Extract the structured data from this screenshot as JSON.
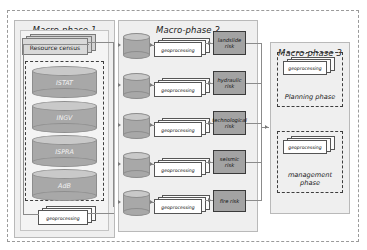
{
  "diagram": {
    "type": "flowchart",
    "title_visible": false,
    "colors": {
      "panel_fill": "#efefef",
      "panel_border": "#b9b9b9",
      "inner_panel_fill": "#f4f4f4",
      "cylinder_body": "#a8a8a8",
      "cylinder_top": "#c9c9c9",
      "risk_box_fill": "#a3a3a3",
      "risk_box_border": "#3a3a3a",
      "card_fill": "#ffffff",
      "card_border": "#555555",
      "dashed_border": "#3d3d3d",
      "outer_dashed_border": "#9a9a9a",
      "connector": "#8b8b8b",
      "resource_census_fill": "#d3d3d3"
    }
  },
  "macro_phase_1": {
    "title": "Macro-phase 1",
    "resource_census": {
      "label": "Resource census"
    },
    "databases": [
      {
        "label": "ISTAT",
        "icon": "database-cylinder-icon"
      },
      {
        "label": "INGV",
        "icon": "database-cylinder-icon"
      },
      {
        "label": "ISPRA",
        "icon": "database-cylinder-icon"
      },
      {
        "label": "AdB",
        "icon": "database-cylinder-icon"
      }
    ],
    "geoprocessing": {
      "label": "geoprocessing"
    }
  },
  "macro_phase_2": {
    "title": "Macro-phase 2",
    "rows": [
      {
        "database": {
          "label": "",
          "icon": "database-cylinder-icon"
        },
        "geoprocessing": {
          "label": "geoprocessing"
        },
        "risk": {
          "label": "landslide risk"
        }
      },
      {
        "database": {
          "label": "",
          "icon": "database-cylinder-icon"
        },
        "geoprocessing": {
          "label": "geoprocessing"
        },
        "risk": {
          "label": "hydraulic risk"
        }
      },
      {
        "database": {
          "label": "",
          "icon": "database-cylinder-icon"
        },
        "geoprocessing": {
          "label": "geoprocessing"
        },
        "risk": {
          "label": "technological risk"
        }
      },
      {
        "database": {
          "label": "",
          "icon": "database-cylinder-icon"
        },
        "geoprocessing": {
          "label": "geoprocessing"
        },
        "risk": {
          "label": "seismic risk"
        }
      },
      {
        "database": {
          "label": "",
          "icon": "database-cylinder-icon"
        },
        "geoprocessing": {
          "label": "geoprocessing"
        },
        "risk": {
          "label": "fire risk"
        }
      }
    ]
  },
  "macro_phase_3": {
    "title": "Macro-phase 3",
    "phases": [
      {
        "geoprocessing": {
          "label": "geoprocessing"
        },
        "label": "Planning phase"
      },
      {
        "geoprocessing": {
          "label": "geoprocessing"
        },
        "label": "management phase"
      }
    ]
  }
}
